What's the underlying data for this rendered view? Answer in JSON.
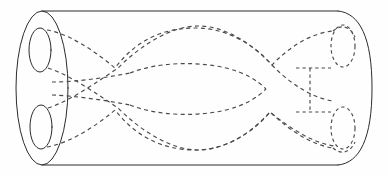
{
  "figure": {
    "title": "Two braided tubes drilled through a solid cylinder",
    "caption": "",
    "domain_kind": "mathematical-diagram",
    "canvas": {
      "width": 388,
      "height": 176,
      "background": "#fefefe"
    },
    "style": {
      "solid_line_color": "#2b2b2b",
      "hidden_line_color": "#4a4a4a",
      "solid_line_width": 1,
      "hidden_line_width": 1.15,
      "hidden_dash_pattern": "4 3.4",
      "fill": "none"
    },
    "parts": {
      "cylinder_label": "cylinder body",
      "front_face_label": "near end disc",
      "far_face_label": "far end cap",
      "hole_upper_label": "upper hole",
      "hole_lower_label": "lower hole",
      "tube_upper_label": "upper tube",
      "tube_lower_label": "lower tube",
      "crossing_label": "tube crossing"
    },
    "geometry": {
      "cylinder": {
        "left_center_x": 42,
        "right_x": 338,
        "top_y": 11,
        "bottom_y": 165,
        "near_ellipse": {
          "cx": 42,
          "cy": 88,
          "rx": 26,
          "ry": 77
        },
        "far_cap_bulge_x": 372
      },
      "near_holes": [
        {
          "cx": 40,
          "cy": 50,
          "rx": 11,
          "ry": 22,
          "name": "upper hole"
        },
        {
          "cx": 41,
          "cy": 127,
          "rx": 11,
          "ry": 22,
          "name": "lower hole"
        }
      ],
      "far_holes": [
        {
          "cx": 343,
          "cy": 46,
          "rx": 12,
          "ry": 21,
          "name": "upper far hole"
        },
        {
          "cx": 343,
          "cy": 128,
          "rx": 12,
          "ry": 21,
          "name": "lower far hole"
        }
      ],
      "crossings": [
        {
          "x": 115,
          "y": 68,
          "name": "left upper crossing"
        },
        {
          "x": 118,
          "y": 108,
          "name": "left lower crossing"
        },
        {
          "x": 272,
          "y": 65,
          "name": "right upper crossing"
        },
        {
          "x": 270,
          "y": 112,
          "name": "right lower crossing"
        }
      ],
      "lens": {
        "left_x": 130,
        "right_x": 266,
        "center_y": 89,
        "half_height": 16
      },
      "outer_arc_peak_y": 28,
      "outer_arc_trough_y": 150
    }
  }
}
